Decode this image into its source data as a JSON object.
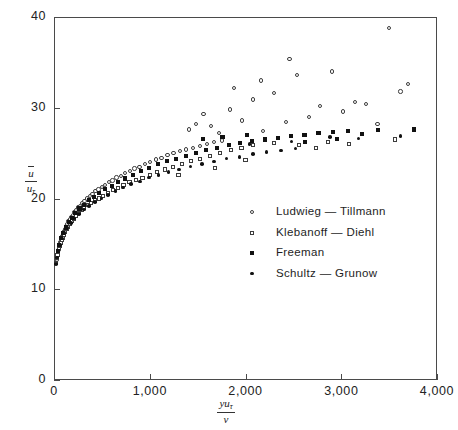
{
  "chart_data": {
    "type": "scatter",
    "title": "",
    "xlabel": "y u_tau / nu",
    "ylabel": "u_bar / u_tau",
    "xlim": [
      0,
      4000
    ],
    "ylim": [
      0,
      40
    ],
    "grid": false,
    "legend_position": "center-right",
    "xticks": [
      {
        "value": 0,
        "label": "0"
      },
      {
        "value": 1000,
        "label": "1,000"
      },
      {
        "value": 2000,
        "label": "2,000"
      },
      {
        "value": 3000,
        "label": "3,000"
      },
      {
        "value": 4000,
        "label": "4,000"
      }
    ],
    "yticks": [
      {
        "value": 0,
        "label": "0"
      },
      {
        "value": 10,
        "label": "10"
      },
      {
        "value": 20,
        "label": "20"
      },
      {
        "value": 30,
        "label": "30"
      },
      {
        "value": 40,
        "label": "40"
      }
    ],
    "series": [
      {
        "name": "Ludwieg — Tillmann",
        "marker": "open-circle",
        "color": "#3c3c3c",
        "points": [
          [
            28,
            13.2
          ],
          [
            34,
            13.6
          ],
          [
            40,
            14.0
          ],
          [
            46,
            14.3
          ],
          [
            52,
            14.6
          ],
          [
            58,
            14.9
          ],
          [
            66,
            15.2
          ],
          [
            74,
            15.5
          ],
          [
            83,
            15.8
          ],
          [
            92,
            16.1
          ],
          [
            102,
            16.4
          ],
          [
            112,
            16.6
          ],
          [
            124,
            16.9
          ],
          [
            136,
            17.2
          ],
          [
            150,
            17.5
          ],
          [
            164,
            17.7
          ],
          [
            180,
            18.0
          ],
          [
            196,
            18.2
          ],
          [
            214,
            18.5
          ],
          [
            232,
            18.7
          ],
          [
            252,
            19.0
          ],
          [
            274,
            19.2
          ],
          [
            296,
            19.5
          ],
          [
            320,
            19.7
          ],
          [
            346,
            20.0
          ],
          [
            374,
            20.3
          ],
          [
            402,
            20.5
          ],
          [
            432,
            20.8
          ],
          [
            464,
            21.0
          ],
          [
            498,
            21.3
          ],
          [
            534,
            21.5
          ],
          [
            572,
            21.8
          ],
          [
            612,
            22.0
          ],
          [
            654,
            22.3
          ],
          [
            698,
            22.5
          ],
          [
            744,
            22.8
          ],
          [
            792,
            23.0
          ],
          [
            842,
            23.3
          ],
          [
            894,
            23.5
          ],
          [
            948,
            23.8
          ],
          [
            1004,
            24.0
          ],
          [
            1062,
            24.3
          ],
          [
            1122,
            24.5
          ],
          [
            1184,
            24.8
          ],
          [
            1248,
            25.0
          ],
          [
            1314,
            25.2
          ],
          [
            1382,
            25.4
          ],
          [
            1452,
            25.6
          ],
          [
            1524,
            25.8
          ],
          [
            1598,
            26.0
          ],
          [
            1674,
            26.2
          ],
          [
            1752,
            26.4
          ],
          [
            1410,
            27.6
          ],
          [
            1480,
            28.2
          ],
          [
            1560,
            29.3
          ],
          [
            1640,
            28.0
          ],
          [
            1720,
            27.2
          ],
          [
            1840,
            29.8
          ],
          [
            1960,
            28.6
          ],
          [
            2080,
            30.9
          ],
          [
            2180,
            27.4
          ],
          [
            2300,
            31.6
          ],
          [
            2420,
            28.4
          ],
          [
            2540,
            33.6
          ],
          [
            2660,
            29.0
          ],
          [
            2780,
            30.2
          ],
          [
            2900,
            34.0
          ],
          [
            3020,
            29.6
          ],
          [
            3140,
            30.6
          ],
          [
            3260,
            30.4
          ],
          [
            3380,
            28.2
          ],
          [
            3500,
            38.8
          ],
          [
            3620,
            31.8
          ],
          [
            3700,
            32.6
          ],
          [
            2460,
            35.4
          ],
          [
            2160,
            33.0
          ],
          [
            1880,
            32.2
          ]
        ]
      },
      {
        "name": "Klebanoff — Diehl",
        "marker": "open-square",
        "color": "#3c3c3c",
        "points": [
          [
            24,
            12.9
          ],
          [
            30,
            13.4
          ],
          [
            37,
            13.8
          ],
          [
            44,
            14.1
          ],
          [
            51,
            14.5
          ],
          [
            60,
            14.8
          ],
          [
            70,
            15.1
          ],
          [
            80,
            15.4
          ],
          [
            91,
            15.7
          ],
          [
            104,
            16.0
          ],
          [
            118,
            16.3
          ],
          [
            133,
            16.6
          ],
          [
            150,
            16.9
          ],
          [
            168,
            17.2
          ],
          [
            188,
            17.5
          ],
          [
            210,
            17.8
          ],
          [
            234,
            18.1
          ],
          [
            260,
            18.4
          ],
          [
            288,
            18.7
          ],
          [
            318,
            19.0
          ],
          [
            352,
            19.3
          ],
          [
            388,
            19.5
          ],
          [
            426,
            19.8
          ],
          [
            468,
            20.0
          ],
          [
            512,
            20.3
          ],
          [
            560,
            20.6
          ],
          [
            612,
            20.9
          ],
          [
            668,
            21.2
          ],
          [
            726,
            21.5
          ],
          [
            788,
            21.8
          ],
          [
            854,
            22.0
          ],
          [
            924,
            22.3
          ],
          [
            998,
            22.6
          ],
          [
            1076,
            22.9
          ],
          [
            1158,
            23.2
          ],
          [
            1244,
            23.5
          ],
          [
            1334,
            23.8
          ],
          [
            1428,
            24.1
          ],
          [
            1526,
            24.4
          ],
          [
            1628,
            24.7
          ],
          [
            1734,
            25.0
          ],
          [
            1844,
            25.3
          ],
          [
            1958,
            25.6
          ],
          [
            2076,
            25.9
          ],
          [
            2300,
            26.1
          ],
          [
            2560,
            25.9
          ],
          [
            2860,
            26.2
          ],
          [
            3080,
            26.0
          ],
          [
            3560,
            26.5
          ],
          [
            2740,
            25.6
          ],
          [
            1300,
            22.6
          ],
          [
            1680,
            23.4
          ],
          [
            2000,
            24.2
          ]
        ]
      },
      {
        "name": "Freeman",
        "marker": "filled-square",
        "color": "#111111",
        "points": [
          [
            40,
            14.2
          ],
          [
            56,
            14.9
          ],
          [
            74,
            15.6
          ],
          [
            96,
            16.2
          ],
          [
            122,
            16.8
          ],
          [
            152,
            17.4
          ],
          [
            186,
            17.9
          ],
          [
            224,
            18.4
          ],
          [
            266,
            18.9
          ],
          [
            312,
            19.3
          ],
          [
            362,
            19.8
          ],
          [
            416,
            20.2
          ],
          [
            474,
            20.6
          ],
          [
            536,
            21.0
          ],
          [
            602,
            21.4
          ],
          [
            672,
            21.8
          ],
          [
            746,
            22.2
          ],
          [
            824,
            22.6
          ],
          [
            906,
            23.0
          ],
          [
            992,
            23.4
          ],
          [
            1082,
            23.8
          ],
          [
            1176,
            24.1
          ],
          [
            1274,
            24.4
          ],
          [
            1376,
            24.7
          ],
          [
            1482,
            25.0
          ],
          [
            1592,
            25.3
          ],
          [
            1706,
            25.6
          ],
          [
            1824,
            25.9
          ],
          [
            1946,
            26.1
          ],
          [
            2072,
            26.3
          ],
          [
            2202,
            26.5
          ],
          [
            2336,
            26.7
          ],
          [
            2474,
            26.9
          ],
          [
            2616,
            27.0
          ],
          [
            2762,
            27.2
          ],
          [
            2912,
            27.3
          ],
          [
            3066,
            27.4
          ],
          [
            3380,
            27.5
          ],
          [
            3760,
            27.6
          ],
          [
            1560,
            26.6
          ],
          [
            1760,
            26.8
          ],
          [
            2020,
            27.0
          ],
          [
            2620,
            26.2
          ],
          [
            2960,
            26.6
          ],
          [
            3220,
            27.1
          ]
        ]
      },
      {
        "name": "Schultz — Grunow",
        "marker": "filled-circle",
        "color": "#111111",
        "points": [
          [
            22,
            12.8
          ],
          [
            32,
            13.5
          ],
          [
            45,
            14.2
          ],
          [
            62,
            14.9
          ],
          [
            84,
            15.6
          ],
          [
            110,
            16.2
          ],
          [
            140,
            16.8
          ],
          [
            176,
            17.3
          ],
          [
            216,
            17.8
          ],
          [
            262,
            18.3
          ],
          [
            312,
            18.8
          ],
          [
            368,
            19.2
          ],
          [
            428,
            19.6
          ],
          [
            494,
            20.0
          ],
          [
            564,
            20.4
          ],
          [
            640,
            20.8
          ],
          [
            720,
            21.2
          ],
          [
            806,
            21.6
          ],
          [
            896,
            21.9
          ],
          [
            992,
            22.3
          ],
          [
            1092,
            22.6
          ],
          [
            1198,
            22.9
          ],
          [
            1308,
            23.2
          ],
          [
            1424,
            23.5
          ],
          [
            1544,
            23.8
          ],
          [
            1670,
            24.1
          ],
          [
            1800,
            24.4
          ],
          [
            1936,
            24.6
          ],
          [
            2076,
            24.9
          ],
          [
            2220,
            25.1
          ],
          [
            2370,
            25.3
          ],
          [
            2524,
            25.5
          ],
          [
            2040,
            26.0
          ],
          [
            2480,
            26.3
          ],
          [
            2880,
            26.8
          ],
          [
            3180,
            26.6
          ],
          [
            3620,
            26.9
          ]
        ]
      }
    ]
  },
  "axis_titles": {
    "y_numerator": "u",
    "y_denominator_base": "u",
    "y_denominator_sub": "τ",
    "x_numerator_y": "y",
    "x_numerator_u": "u",
    "x_numerator_sub": "τ",
    "x_denominator": "ν"
  },
  "legend": {
    "items": [
      {
        "label": "Ludwieg — Tillmann",
        "marker": "open-circle"
      },
      {
        "label": "Klebanoff — Diehl",
        "marker": "open-square"
      },
      {
        "label": "Freeman",
        "marker": "filled-square"
      },
      {
        "label": "Schultz — Grunow",
        "marker": "filled-circle"
      }
    ]
  }
}
